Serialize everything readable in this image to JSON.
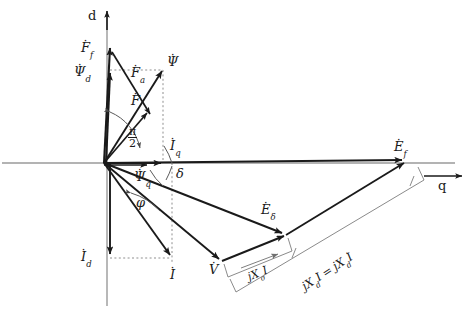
{
  "figure": {
    "background_color": "#ffffff",
    "stroke_color": "#1a1a1a",
    "light_stroke_color": "#8a8a8a",
    "width": 471,
    "height": 318
  },
  "axes": {
    "d_axis_label": "d",
    "q_axis_label": "q",
    "origin": {
      "x": 103,
      "y": 163
    }
  },
  "angles": [
    {
      "name": "pi-over-2",
      "numerator": "π",
      "denominator": "2",
      "x": 128,
      "y": 132
    },
    {
      "name": "delta",
      "label": "δ",
      "x": 173,
      "y": 171
    },
    {
      "name": "phi",
      "label": "φ",
      "x": 136,
      "y": 200
    }
  ],
  "phasors": [
    {
      "name": "F-f",
      "base": "F",
      "sub": "f",
      "overdot": true,
      "x": 81,
      "y": 43
    },
    {
      "name": "Psi-d",
      "base": "Ψ",
      "sub": "d",
      "overdot": true,
      "x": 76,
      "y": 67
    },
    {
      "name": "F-a",
      "base": "F",
      "sub": "a",
      "overdot": true,
      "x": 131,
      "y": 68
    },
    {
      "name": "F",
      "base": "F",
      "sub": "",
      "overdot": true,
      "x": 129,
      "y": 96
    },
    {
      "name": "Psi",
      "base": "Ψ",
      "sub": "",
      "overdot": true,
      "x": 165,
      "y": 57
    },
    {
      "name": "I-q",
      "base": "I",
      "sub": "q",
      "overdot": true,
      "x": 168,
      "y": 141
    },
    {
      "name": "Psi-q",
      "base": "Ψ",
      "sub": "q",
      "overdot": true,
      "x": 136,
      "y": 172
    },
    {
      "name": "I-d",
      "base": "I",
      "sub": "d",
      "overdot": true,
      "x": 81,
      "y": 252
    },
    {
      "name": "I",
      "base": "I",
      "sub": "",
      "overdot": true,
      "x": 170,
      "y": 272
    },
    {
      "name": "V",
      "base": "V",
      "sub": "",
      "overdot": true,
      "x": 209,
      "y": 266
    },
    {
      "name": "E-delta",
      "base": "E",
      "sub": "δ",
      "overdot": true,
      "x": 262,
      "y": 205
    },
    {
      "name": "E-f",
      "base": "E",
      "sub": "f",
      "overdot": true,
      "x": 394,
      "y": 143
    }
  ],
  "bracket_labels": [
    {
      "name": "jXsigma-I",
      "text": "j Xσ İ",
      "parts": {
        "j": "j",
        "X": "X",
        "sub": "σ",
        "I": "I"
      },
      "x": 248,
      "y": 266,
      "rotation": -19
    },
    {
      "name": "jXd-I-equals-jXd-I",
      "text": "j Xd İ = j Xd İ",
      "parts": {
        "j": "j",
        "X": "X",
        "sub": "d",
        "I": "I",
        "equals": "="
      },
      "x": 316,
      "y": 276,
      "rotation": -33
    }
  ]
}
